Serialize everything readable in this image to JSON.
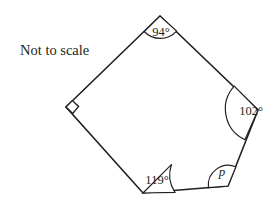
{
  "figure": {
    "note": "Not to scale",
    "shape_name": "pentagon",
    "stroke_color": "#231f20",
    "background_color": "#ffffff",
    "vertices": [
      {
        "name": "top-vertex",
        "x": 160,
        "y": 16
      },
      {
        "name": "right-vertex",
        "x": 258,
        "y": 110
      },
      {
        "name": "bottom-right-vertex",
        "x": 228,
        "y": 186
      },
      {
        "name": "bottom-left-vertex",
        "x": 143,
        "y": 193
      },
      {
        "name": "left-vertex",
        "x": 66,
        "y": 107
      }
    ],
    "angles": [
      {
        "id": "top",
        "label": "94°",
        "value": "94",
        "unit": "degrees",
        "italic": false,
        "vertex": "top-vertex",
        "label_x": 161,
        "label_y": 33,
        "arc_radius": 23
      },
      {
        "id": "right",
        "label": "102°",
        "value": "102",
        "unit": "degrees",
        "italic": false,
        "vertex": "right-vertex",
        "label_x": 251,
        "label_y": 112,
        "arc_radius": 34
      },
      {
        "id": "bottom-right",
        "label": "p",
        "value": "p",
        "unit": "variable",
        "italic": true,
        "vertex": "bottom-right-vertex",
        "label_x": 222,
        "label_y": 173,
        "arc_radius": 20
      },
      {
        "id": "bottom-left",
        "label": "119°",
        "value": "119",
        "unit": "degrees",
        "italic": false,
        "vertex": "bottom-left-vertex",
        "label_x": 157,
        "label_y": 181,
        "arc_radius": 32
      },
      {
        "id": "left",
        "label": "",
        "value": "90",
        "unit": "degrees",
        "italic": false,
        "vertex": "left-vertex",
        "marker": "right-angle-square",
        "marker_size": 9
      }
    ],
    "note_x": 20,
    "note_y": 52
  }
}
